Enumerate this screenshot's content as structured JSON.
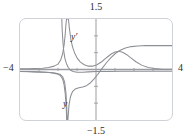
{
  "chart_data": {
    "type": "line",
    "title": "",
    "subtitle": "",
    "xlabel": "",
    "ylabel": "",
    "xlim": [
      -4,
      4
    ],
    "ylim": [
      -1.5,
      1.5
    ],
    "grid": false,
    "legend_position": "inline-annotation",
    "axis_labels": {
      "y_max": "1.5",
      "y_min": "−1.5",
      "x_min": "−4",
      "x_max": "4"
    },
    "x_tick_count": 8,
    "y_tick_count": 6,
    "x_tick_values": [
      -3,
      -2,
      -1,
      1,
      2,
      3
    ],
    "y_tick_values": [
      -1.0,
      -0.5,
      0.5,
      1.0
    ],
    "annotations": [
      {
        "text": "y′",
        "x": -0.75,
        "y": 0.92
      },
      {
        "text": "y",
        "x": -1.1,
        "y": -0.96
      }
    ],
    "vertical_asymptote_x": -1.5,
    "series": [
      {
        "name": "y",
        "color": "#8c8f94",
        "points": [
          [
            -4.0,
            -0.06
          ],
          [
            -3.6,
            -0.06
          ],
          [
            -3.2,
            -0.07
          ],
          [
            -2.8,
            -0.08
          ],
          [
            -2.4,
            -0.09
          ],
          [
            -2.1,
            -0.11
          ],
          [
            -1.9,
            -0.14
          ],
          [
            -1.75,
            -0.22
          ],
          [
            -1.65,
            -0.38
          ],
          [
            -1.58,
            -0.7
          ],
          [
            -1.54,
            -1.1
          ],
          [
            -1.52,
            -1.5
          ],
          [
            -1.48,
            -1.5
          ],
          [
            -1.42,
            -1.05
          ],
          [
            -1.34,
            -0.8
          ],
          [
            -1.24,
            -0.66
          ],
          [
            -1.1,
            -0.58
          ],
          [
            -0.9,
            -0.54
          ],
          [
            -0.7,
            -0.52
          ],
          [
            -0.5,
            -0.48
          ],
          [
            -0.3,
            -0.4
          ],
          [
            -0.1,
            -0.28
          ],
          [
            0.1,
            -0.14
          ],
          [
            0.3,
            0.02
          ],
          [
            0.55,
            0.2
          ],
          [
            0.8,
            0.36
          ],
          [
            1.05,
            0.49
          ],
          [
            1.3,
            0.58
          ],
          [
            1.55,
            0.64
          ],
          [
            1.85,
            0.68
          ],
          [
            2.2,
            0.7
          ],
          [
            2.6,
            0.71
          ],
          [
            3.0,
            0.71
          ],
          [
            3.4,
            0.71
          ],
          [
            3.8,
            0.71
          ],
          [
            4.0,
            0.71
          ]
        ]
      },
      {
        "name": "y'",
        "color": "#8c8f94",
        "points": [
          [
            -4.0,
            0.02
          ],
          [
            -3.6,
            0.02
          ],
          [
            -3.2,
            0.03
          ],
          [
            -2.8,
            0.04
          ],
          [
            -2.5,
            0.06
          ],
          [
            -2.2,
            0.1
          ],
          [
            -2.0,
            0.16
          ],
          [
            -1.86,
            0.28
          ],
          [
            -1.76,
            0.46
          ],
          [
            -1.68,
            0.72
          ],
          [
            -1.62,
            1.05
          ],
          [
            -1.58,
            1.35
          ],
          [
            -1.55,
            1.5
          ],
          [
            -1.45,
            1.5
          ],
          [
            -1.4,
            1.22
          ],
          [
            -1.33,
            0.92
          ],
          [
            -1.24,
            0.68
          ],
          [
            -1.12,
            0.48
          ],
          [
            -0.98,
            0.33
          ],
          [
            -0.82,
            0.22
          ],
          [
            -0.62,
            0.14
          ],
          [
            -0.4,
            0.1
          ],
          [
            -0.18,
            0.1
          ],
          [
            0.05,
            0.14
          ],
          [
            0.3,
            0.23
          ],
          [
            0.55,
            0.35
          ],
          [
            0.8,
            0.46
          ],
          [
            1.0,
            0.52
          ],
          [
            1.2,
            0.54
          ],
          [
            1.4,
            0.51
          ],
          [
            1.62,
            0.44
          ],
          [
            1.85,
            0.34
          ],
          [
            2.1,
            0.23
          ],
          [
            2.4,
            0.13
          ],
          [
            2.75,
            0.06
          ],
          [
            3.1,
            0.03
          ],
          [
            3.5,
            0.01
          ],
          [
            4.0,
            0.01
          ]
        ]
      },
      {
        "name": "y-branch-left",
        "color": "#8c8f94",
        "points": [
          [
            -4.0,
            -0.06
          ],
          [
            -3.5,
            -0.065
          ],
          [
            -3.0,
            -0.07
          ],
          [
            -2.6,
            -0.08
          ],
          [
            -2.3,
            -0.1
          ],
          [
            -2.05,
            -0.13
          ],
          [
            -1.88,
            -0.18
          ],
          [
            -1.76,
            -0.28
          ],
          [
            -1.68,
            -0.45
          ],
          [
            -1.62,
            -0.72
          ],
          [
            -1.57,
            -1.1
          ],
          [
            -1.54,
            -1.5
          ]
        ]
      },
      {
        "name": "yprime-branch-left",
        "color": "#8c8f94",
        "points": [
          [
            -1.8,
            1.5
          ],
          [
            -1.78,
            1.18
          ],
          [
            -1.74,
            0.82
          ],
          [
            -1.7,
            0.56
          ],
          [
            -1.64,
            0.34
          ],
          [
            -1.56,
            0.18
          ],
          [
            -1.46,
            0.06
          ],
          [
            -1.34,
            -0.02
          ],
          [
            -1.2,
            -0.06
          ],
          [
            -1.0,
            -0.08
          ],
          [
            -0.7,
            -0.08
          ],
          [
            -0.4,
            -0.07
          ],
          [
            0.0,
            -0.06
          ],
          [
            0.6,
            -0.06
          ],
          [
            1.4,
            -0.05
          ],
          [
            2.2,
            -0.05
          ],
          [
            3.0,
            -0.05
          ],
          [
            4.0,
            -0.05
          ]
        ]
      }
    ]
  },
  "style": {
    "frame_color": "#cfd2d6",
    "axis_color": "#9a9da2",
    "curve_color": "#8c8f94",
    "text_color": "#2b2b2b",
    "background": "#ffffff"
  }
}
